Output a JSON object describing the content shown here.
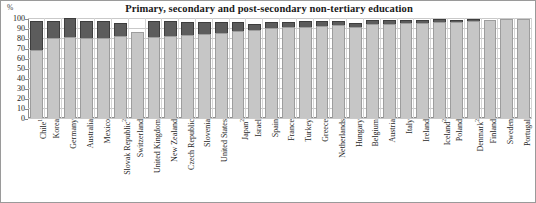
{
  "chart": {
    "title": "Primary, secondary and post-secondary non-tertiary education",
    "yaxis_unit": "%"
  },
  "chart_data": {
    "type": "bar",
    "title": "Primary, secondary and post-secondary non-tertiary education",
    "subtitle": "",
    "xlabel": "",
    "ylabel": "%",
    "ylim": [
      0,
      100
    ],
    "yticks": [
      0,
      10,
      20,
      30,
      40,
      50,
      60,
      70,
      80,
      90,
      100
    ],
    "grid": true,
    "legend": "none",
    "stacked": true,
    "categories": [
      "Chile¹",
      "Korea",
      "Germany",
      "Australia",
      "Mexico",
      "Slovak Republic²",
      "Switzerland",
      "United Kingdom",
      "New Zealand",
      "Czech Republic",
      "Slovenia",
      "United States",
      "Japan²",
      "Israel",
      "Spain",
      "France",
      "Turkey",
      "Greece",
      "Netherlands",
      "Hungary",
      "Belgium",
      "Austria",
      "Italy",
      "Ireland",
      "Iceland²",
      "Poland",
      "Denmark²",
      "Finland",
      "Sweden",
      "Portugal"
    ],
    "series": [
      {
        "name": "lower-segment",
        "values": [
          68,
          80,
          81,
          80,
          80,
          82,
          86,
          81,
          82,
          83,
          84,
          85,
          87,
          88,
          90,
          91,
          91,
          92,
          93,
          91,
          94,
          94,
          95,
          95,
          96,
          96,
          97,
          98,
          99,
          99
        ]
      },
      {
        "name": "upper-segment",
        "values": [
          29,
          17,
          19,
          17,
          17,
          13,
          0,
          16,
          15,
          13,
          12,
          11,
          9,
          6,
          6,
          5,
          6,
          5,
          4,
          4,
          4,
          4,
          3,
          3,
          3,
          2,
          2,
          0,
          0,
          0
        ]
      }
    ],
    "totals": [
      97,
      97,
      100,
      97,
      97,
      95,
      86,
      97,
      97,
      96,
      96,
      96,
      96,
      94,
      96,
      96,
      97,
      97,
      97,
      95,
      98,
      98,
      98,
      98,
      99,
      98,
      99,
      98,
      99,
      99
    ],
    "colors": {
      "lower": "#c6c6c6",
      "upper": "#5c5c5c",
      "grid": "#c9c9c9",
      "axis": "#8d8d8d"
    }
  }
}
